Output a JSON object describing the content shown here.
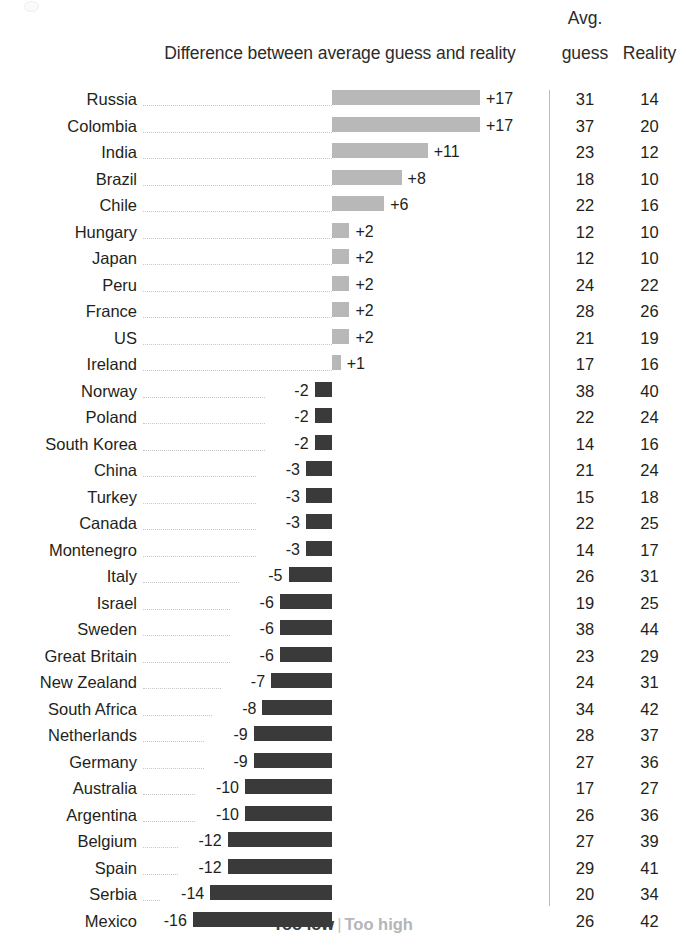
{
  "header": {
    "chart_title": "Difference between average guess and reality",
    "avg_top": "Avg.",
    "avg_bottom": "guess",
    "reality": "Reality"
  },
  "legend": {
    "too_low": "Too low",
    "separator": "|",
    "too_high": "Too high"
  },
  "colors": {
    "positive_bar": "#b8b8b8",
    "negative_bar": "#3a3a3a",
    "text": "#231f20",
    "leader_line": "#c9c7c5",
    "divider": "#bcbcbc"
  },
  "chart_data": {
    "type": "bar",
    "title": "Difference between average guess and reality",
    "xlabel": "",
    "ylabel": "",
    "orientation": "horizontal",
    "diverging": true,
    "zero_baseline_x": 332,
    "px_per_unit": 8.7,
    "grid": false,
    "legend_position": "bottom",
    "legend_entries": [
      "Too low",
      "Too high"
    ],
    "columns": [
      "Country",
      "Difference",
      "Avg. guess",
      "Reality"
    ],
    "categories": [
      "Russia",
      "Colombia",
      "India",
      "Brazil",
      "Chile",
      "Hungary",
      "Japan",
      "Peru",
      "France",
      "US",
      "Ireland",
      "Norway",
      "Poland",
      "South Korea",
      "China",
      "Turkey",
      "Canada",
      "Montenegro",
      "Italy",
      "Israel",
      "Sweden",
      "Great Britain",
      "New Zealand",
      "South Africa",
      "Netherlands",
      "Germany",
      "Australia",
      "Argentina",
      "Belgium",
      "Spain",
      "Serbia",
      "Mexico"
    ],
    "series": [
      {
        "name": "Difference",
        "values": [
          17,
          17,
          11,
          8,
          6,
          2,
          2,
          2,
          2,
          2,
          1,
          -2,
          -2,
          -2,
          -3,
          -3,
          -3,
          -3,
          -5,
          -6,
          -6,
          -6,
          -7,
          -8,
          -9,
          -9,
          -10,
          -10,
          -12,
          -12,
          -14,
          -16
        ]
      },
      {
        "name": "Avg. guess",
        "values": [
          31,
          37,
          23,
          18,
          22,
          12,
          12,
          24,
          28,
          21,
          17,
          38,
          22,
          14,
          21,
          15,
          22,
          14,
          26,
          19,
          38,
          23,
          24,
          34,
          28,
          27,
          17,
          26,
          27,
          29,
          20,
          26
        ]
      },
      {
        "name": "Reality",
        "values": [
          14,
          20,
          12,
          10,
          16,
          10,
          10,
          22,
          26,
          19,
          16,
          40,
          24,
          16,
          24,
          18,
          25,
          17,
          31,
          25,
          44,
          29,
          31,
          42,
          37,
          36,
          27,
          36,
          39,
          41,
          34,
          42
        ]
      }
    ]
  },
  "rows": [
    {
      "country": "Russia",
      "diff": 17,
      "diff_label": "+17",
      "guess": "31",
      "reality": "14"
    },
    {
      "country": "Colombia",
      "diff": 17,
      "diff_label": "+17",
      "guess": "37",
      "reality": "20"
    },
    {
      "country": "India",
      "diff": 11,
      "diff_label": "+11",
      "guess": "23",
      "reality": "12"
    },
    {
      "country": "Brazil",
      "diff": 8,
      "diff_label": "+8",
      "guess": "18",
      "reality": "10"
    },
    {
      "country": "Chile",
      "diff": 6,
      "diff_label": "+6",
      "guess": "22",
      "reality": "16"
    },
    {
      "country": "Hungary",
      "diff": 2,
      "diff_label": "+2",
      "guess": "12",
      "reality": "10"
    },
    {
      "country": "Japan",
      "diff": 2,
      "diff_label": "+2",
      "guess": "12",
      "reality": "10"
    },
    {
      "country": "Peru",
      "diff": 2,
      "diff_label": "+2",
      "guess": "24",
      "reality": "22"
    },
    {
      "country": "France",
      "diff": 2,
      "diff_label": "+2",
      "guess": "28",
      "reality": "26"
    },
    {
      "country": "US",
      "diff": 2,
      "diff_label": "+2",
      "guess": "21",
      "reality": "19"
    },
    {
      "country": "Ireland",
      "diff": 1,
      "diff_label": "+1",
      "guess": "17",
      "reality": "16"
    },
    {
      "country": "Norway",
      "diff": -2,
      "diff_label": "-2",
      "guess": "38",
      "reality": "40"
    },
    {
      "country": "Poland",
      "diff": -2,
      "diff_label": "-2",
      "guess": "22",
      "reality": "24"
    },
    {
      "country": "South Korea",
      "diff": -2,
      "diff_label": "-2",
      "guess": "14",
      "reality": "16"
    },
    {
      "country": "China",
      "diff": -3,
      "diff_label": "-3",
      "guess": "21",
      "reality": "24"
    },
    {
      "country": "Turkey",
      "diff": -3,
      "diff_label": "-3",
      "guess": "15",
      "reality": "18"
    },
    {
      "country": "Canada",
      "diff": -3,
      "diff_label": "-3",
      "guess": "22",
      "reality": "25"
    },
    {
      "country": "Montenegro",
      "diff": -3,
      "diff_label": "-3",
      "guess": "14",
      "reality": "17"
    },
    {
      "country": "Italy",
      "diff": -5,
      "diff_label": "-5",
      "guess": "26",
      "reality": "31"
    },
    {
      "country": "Israel",
      "diff": -6,
      "diff_label": "-6",
      "guess": "19",
      "reality": "25"
    },
    {
      "country": "Sweden",
      "diff": -6,
      "diff_label": "-6",
      "guess": "38",
      "reality": "44"
    },
    {
      "country": "Great Britain",
      "diff": -6,
      "diff_label": "-6",
      "guess": "23",
      "reality": "29"
    },
    {
      "country": "New Zealand",
      "diff": -7,
      "diff_label": "-7",
      "guess": "24",
      "reality": "31"
    },
    {
      "country": "South Africa",
      "diff": -8,
      "diff_label": "-8",
      "guess": "34",
      "reality": "42"
    },
    {
      "country": "Netherlands",
      "diff": -9,
      "diff_label": "-9",
      "guess": "28",
      "reality": "37"
    },
    {
      "country": "Germany",
      "diff": -9,
      "diff_label": "-9",
      "guess": "27",
      "reality": "36"
    },
    {
      "country": "Australia",
      "diff": -10,
      "diff_label": "-10",
      "guess": "17",
      "reality": "27"
    },
    {
      "country": "Argentina",
      "diff": -10,
      "diff_label": "-10",
      "guess": "26",
      "reality": "36"
    },
    {
      "country": "Belgium",
      "diff": -12,
      "diff_label": "-12",
      "guess": "27",
      "reality": "39"
    },
    {
      "country": "Spain",
      "diff": -12,
      "diff_label": "-12",
      "guess": "29",
      "reality": "41"
    },
    {
      "country": "Serbia",
      "diff": -14,
      "diff_label": "-14",
      "guess": "20",
      "reality": "34"
    },
    {
      "country": "Mexico",
      "diff": -16,
      "diff_label": "-16",
      "guess": "26",
      "reality": "42"
    }
  ]
}
